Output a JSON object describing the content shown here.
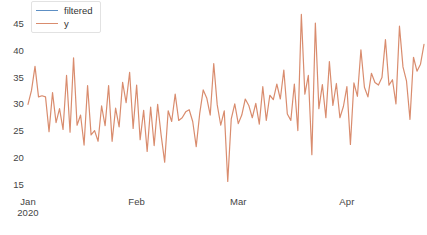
{
  "chart_data": {
    "type": "line",
    "title": "",
    "xlabel": "",
    "ylabel": "",
    "ylim": [
      14,
      48
    ],
    "yticks": [
      15,
      20,
      25,
      30,
      35,
      40,
      45
    ],
    "grid": false,
    "legend_position": "top-left",
    "x_axis_type": "date",
    "x_start": "2020-01-01",
    "x_end": "2020-04-13",
    "xticks": [
      {
        "label": "Jan",
        "sublabel": "2020",
        "index": 0
      },
      {
        "label": "Feb",
        "sublabel": "",
        "index": 31
      },
      {
        "label": "Mar",
        "sublabel": "",
        "index": 60
      },
      {
        "label": "Apr",
        "sublabel": "",
        "index": 91
      }
    ],
    "series": [
      {
        "name": "filtered",
        "color": "#5d8fc4",
        "values": []
      },
      {
        "name": "y",
        "color": "#d98c6e",
        "values": [
          30.0,
          32.6,
          37.1,
          31.4,
          31.6,
          31.4,
          24.9,
          32.2,
          26.6,
          29.2,
          25.3,
          35.4,
          24.8,
          38.7,
          26.1,
          28.0,
          22.4,
          33.5,
          24.3,
          25.1,
          23.1,
          29.7,
          26.0,
          33.5,
          23.1,
          29.3,
          25.8,
          34.1,
          30.3,
          36.0,
          25.5,
          33.6,
          23.4,
          28.9,
          21.2,
          29.5,
          22.3,
          30.0,
          24.2,
          19.2,
          28.8,
          26.8,
          31.9,
          27.0,
          27.5,
          28.6,
          29.0,
          26.8,
          22.1,
          28.3,
          32.7,
          31.2,
          28.0,
          37.6,
          29.9,
          26.1,
          28.8,
          15.6,
          27.3,
          30.1,
          26.4,
          28.0,
          31.0,
          29.8,
          27.5,
          30.2,
          26.3,
          33.3,
          27.0,
          31.7,
          30.9,
          33.8,
          31.0,
          36.4,
          28.2,
          27.0,
          33.8,
          25.1,
          46.8,
          31.9,
          35.4,
          20.6,
          45.2,
          29.2,
          33.7,
          27.5,
          38.0,
          29.8,
          33.9,
          27.5,
          29.6,
          33.3,
          22.5,
          34.0,
          31.5,
          40.2,
          33.2,
          31.4,
          35.8,
          34.1,
          33.6,
          35.0,
          42.1,
          33.6,
          34.6,
          30.1,
          44.6,
          37.0,
          34.4,
          27.2,
          38.8,
          36.2,
          37.5,
          41.2
        ]
      }
    ]
  },
  "legend": {
    "items": [
      {
        "label": "filtered",
        "color": "#5d8fc4"
      },
      {
        "label": "y",
        "color": "#d98c6e"
      }
    ]
  },
  "axis": {
    "y_labels": [
      "45",
      "40",
      "35",
      "30",
      "25",
      "20",
      "15"
    ],
    "x_labels": [
      "Jan",
      "Feb",
      "Mar",
      "Apr"
    ],
    "x_sublabel": "2020"
  }
}
